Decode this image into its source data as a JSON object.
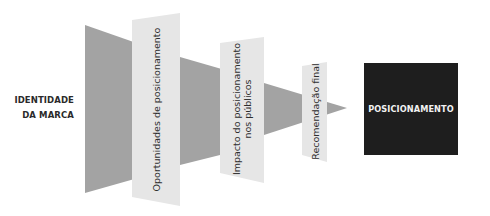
{
  "diagram": {
    "type": "funnel",
    "input_label_lines": [
      "IDENTIDADE",
      "DA MARCA"
    ],
    "stages": [
      {
        "label": "Oportunidades de posicionamento"
      },
      {
        "label_lines": [
          "Impacto do posicionamento",
          "nos públicos"
        ]
      },
      {
        "label": "Recomendação final"
      }
    ],
    "output_label": "POSICIONAMENTO",
    "colors": {
      "funnel_gray": "#a3a3a3",
      "panel_light": "#e6e6e6",
      "output_box": "#1e1e1e",
      "output_text": "#f2f2f2",
      "text": "#2e2e2e"
    }
  }
}
